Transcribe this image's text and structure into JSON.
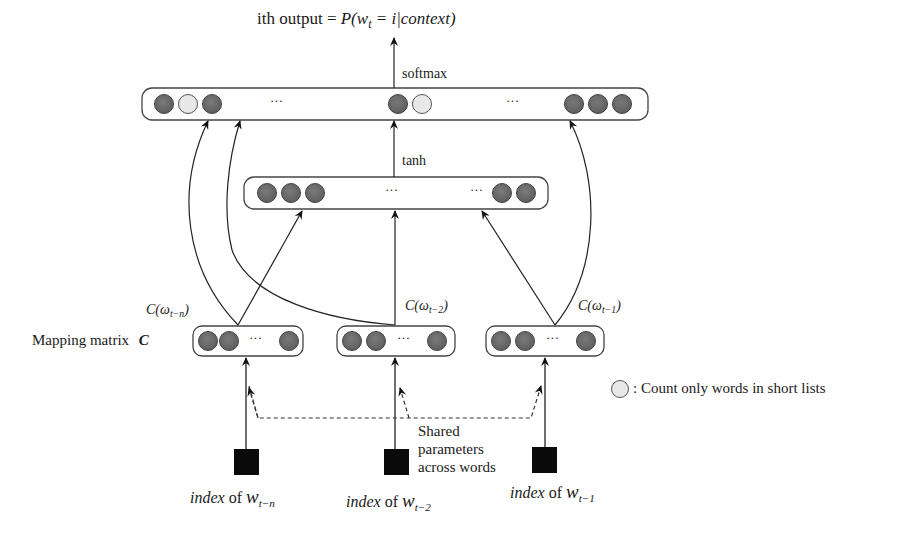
{
  "title": {
    "prefix": "ith output = ",
    "formula": "P(w",
    "formula_sub": "t",
    "formula_rest": " = i|context)"
  },
  "labels": {
    "softmax": "softmax",
    "tanh": "tanh",
    "mapping_matrix": "Mapping matrix",
    "mapping_matrix_symbol": "C",
    "shared_line1": "Shared",
    "shared_line2": "parameters",
    "shared_line3": "across words",
    "ellipsis": "···"
  },
  "embeddings": [
    {
      "label": "C(ω",
      "sub": "t−n",
      "close": ")"
    },
    {
      "label": "C(ω",
      "sub": "t−2",
      "close": ")"
    },
    {
      "label": "C(ω",
      "sub": "t−1",
      "close": ")"
    }
  ],
  "inputs": [
    {
      "prefix": "index",
      "of": " of ",
      "word": "w",
      "sub": "t−n"
    },
    {
      "prefix": "index",
      "of": " of ",
      "word": "w",
      "sub": "t−2"
    },
    {
      "prefix": "index",
      "of": " of ",
      "word": "w",
      "sub": "t−1"
    }
  ],
  "legend": {
    "text": ": Count only words in short lists"
  },
  "colors": {
    "filled_node": "#6b6b6b",
    "empty_node": "#e6e6e6",
    "stroke": "#333333",
    "input_square": "#0a0a0a"
  }
}
